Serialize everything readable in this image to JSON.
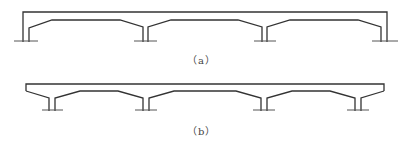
{
  "figure": {
    "panels": [
      {
        "id": "a",
        "caption": "（a）",
        "description": "Continuous rigid frame with end verticals and haunched girder over 4 supports"
      },
      {
        "id": "b",
        "caption": "（b）",
        "description": "Continuous girder with cantilevered ends over 4 piers with haunches"
      }
    ],
    "colors": {
      "line": "#333333",
      "background": "#ffffff"
    }
  }
}
